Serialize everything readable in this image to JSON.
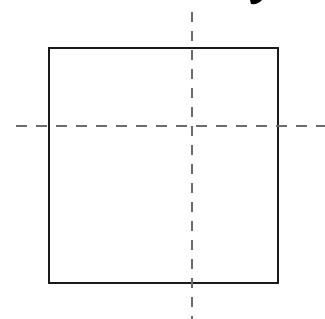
{
  "diagram": {
    "square": {
      "x": 49,
      "y": 48,
      "width": 229,
      "height": 235,
      "stroke": "#1a1a1a",
      "stroke_width": 2
    },
    "vertical_line": {
      "x": 192,
      "y1": 12,
      "y2": 319,
      "stroke": "#6b6b6b",
      "dash": "10,9"
    },
    "horizontal_line": {
      "y": 126,
      "x1": 14,
      "x2": 325,
      "stroke": "#6b6b6b",
      "dash": "11,9"
    },
    "corner_mark": {
      "color": "#000000"
    }
  }
}
